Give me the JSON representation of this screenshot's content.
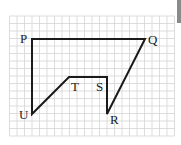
{
  "diagram": {
    "type": "polygon-on-grid",
    "grid": {
      "cell_px": 7.5,
      "x0": 9.5,
      "y0": 16,
      "cols": 22,
      "rows": 16,
      "color": "#d4d4d4"
    },
    "outline_color": "#1a1a1a",
    "vertices": [
      {
        "label": "P",
        "x": 32,
        "y": 39,
        "lx": 20,
        "ly": 43
      },
      {
        "label": "Q",
        "x": 145,
        "y": 39,
        "lx": 148,
        "ly": 44
      },
      {
        "label": "R",
        "x": 107,
        "y": 114,
        "lx": 110,
        "ly": 124
      },
      {
        "label": "S",
        "x": 107,
        "y": 77,
        "lx": 96,
        "ly": 91
      },
      {
        "label": "T",
        "x": 69,
        "y": 77,
        "lx": 71,
        "ly": 91
      },
      {
        "label": "U",
        "x": 32,
        "y": 114,
        "lx": 19,
        "ly": 119
      }
    ],
    "labels": {
      "P": "P",
      "Q": "Q",
      "R": "R",
      "S": "S",
      "T": "T",
      "U": "U"
    }
  }
}
